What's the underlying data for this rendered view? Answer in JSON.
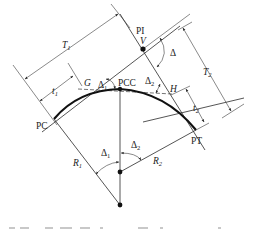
{
  "diagram": {
    "type": "compound-curve",
    "colors": {
      "line": "#2a2a2a",
      "curve": "#111111",
      "background": "#ffffff"
    },
    "points": {
      "pi": {
        "label": "PI",
        "sub_label": "V"
      },
      "pc": {
        "label": "PC"
      },
      "pcc": {
        "label": "PCC"
      },
      "pt": {
        "label": "PT"
      },
      "g": {
        "label": "G"
      },
      "h": {
        "label": "H"
      }
    },
    "dimensions": {
      "t1": {
        "main": "T",
        "sub": "1"
      },
      "t2": {
        "main": "T",
        "sub": "2"
      },
      "t_small_1": {
        "main": "t",
        "sub": "1"
      },
      "t_small_2": {
        "main": "t",
        "sub": "2"
      },
      "r1": {
        "main": "R",
        "sub": "1"
      },
      "r2": {
        "main": "R",
        "sub": "2"
      }
    },
    "angles": {
      "delta": {
        "symbol": "Δ"
      },
      "delta1_top": {
        "symbol": "Δ",
        "sub": "1"
      },
      "delta2_top": {
        "symbol": "Δ",
        "sub": "2"
      },
      "delta1_center": {
        "symbol": "Δ",
        "sub": "1"
      },
      "delta2_center": {
        "symbol": "Δ",
        "sub": "2"
      }
    },
    "caption_note": "partially cropped, illegible"
  }
}
